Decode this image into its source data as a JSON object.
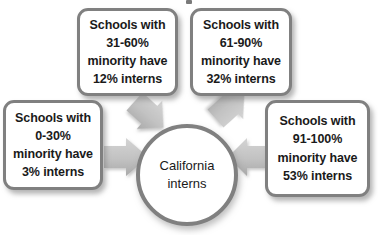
{
  "diagram": {
    "type": "hub-and-spoke",
    "title_partial": "",
    "center": {
      "name": "california-interns-hub",
      "lines": [
        "California",
        "interns"
      ],
      "shape": "circle"
    },
    "border_color": "#808080",
    "arrow_color": "#bdbdbd",
    "background_color": "#ffffff",
    "text_color": "#1a1a1a",
    "boxes": [
      {
        "id": "box-low",
        "name": "callout-minority-0-30",
        "position": "left",
        "minority_range": "0-30%",
        "interns_percent": "3%",
        "lines": [
          "Schools with",
          "0-30%",
          "minority have",
          "3% interns"
        ]
      },
      {
        "id": "box-mid-low",
        "name": "callout-minority-31-60",
        "position": "top-left",
        "minority_range": "31-60%",
        "interns_percent": "12%",
        "lines": [
          "Schools with",
          "31-60%",
          "minority have",
          "12% interns"
        ]
      },
      {
        "id": "box-mid-high",
        "name": "callout-minority-61-90",
        "position": "top-right",
        "minority_range": "61-90%",
        "interns_percent": "32%",
        "lines": [
          "Schools with",
          "61-90%",
          "minority have",
          "32% interns"
        ]
      },
      {
        "id": "box-high",
        "name": "callout-minority-91-100",
        "position": "right",
        "minority_range": "91-100%",
        "interns_percent": "53%",
        "lines": [
          "Schools with",
          "91-100%",
          "minority have",
          "53% interns"
        ]
      }
    ],
    "arrows": [
      {
        "name": "arrow-from-0-30",
        "direction": "right"
      },
      {
        "name": "arrow-from-31-60",
        "direction": "down-right"
      },
      {
        "name": "arrow-from-61-90",
        "direction": "down-left"
      },
      {
        "name": "arrow-from-91-100",
        "direction": "left"
      }
    ]
  }
}
